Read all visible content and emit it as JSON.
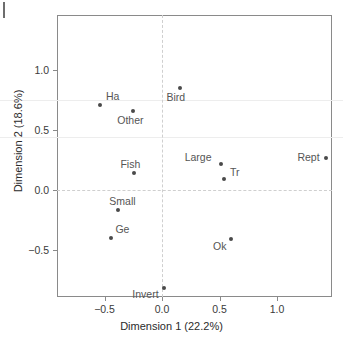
{
  "chart_data": {
    "type": "scatter",
    "title": "",
    "xlabel": "Dimension 1 (22.2%)",
    "ylabel": "Dimension 2 (18.6%)",
    "xlim": [
      -0.91,
      1.48
    ],
    "ylim": [
      -0.92,
      1.35
    ],
    "xticks": [
      "-0.5",
      "0.0",
      "0.5",
      "1.0"
    ],
    "xtick_values": [
      -0.5,
      0.0,
      0.5,
      1.0
    ],
    "yticks": [
      "-0.5",
      "0.0",
      "0.5",
      "1.0"
    ],
    "ytick_values": [
      -0.5,
      0.0,
      0.5,
      1.0
    ],
    "grid": "faint horizontal lines at y=0.75 and y=0.44; dashed reference lines at x=0 and y=0",
    "legend": "none",
    "point_color": "#4a4a4a",
    "label_color": "#555555",
    "points": [
      {
        "label": "Ha",
        "x": -0.54,
        "y": 0.71,
        "label_dx": 6,
        "label_dy": -14
      },
      {
        "label": "Other",
        "x": -0.25,
        "y": 0.66,
        "label_dx": -16,
        "label_dy": 4
      },
      {
        "label": "Bird",
        "x": 0.16,
        "y": 0.85,
        "label_dx": -14,
        "label_dy": 4
      },
      {
        "label": "Fish",
        "x": -0.24,
        "y": 0.14,
        "label_dx": -14,
        "label_dy": -14
      },
      {
        "label": "Large",
        "x": 0.51,
        "y": 0.22,
        "label_dx": -36,
        "label_dy": -12
      },
      {
        "label": "Tr",
        "x": 0.54,
        "y": 0.09,
        "label_dx": 6,
        "label_dy": -12
      },
      {
        "label": "Rept",
        "x": 1.43,
        "y": 0.27,
        "label_dx": -29,
        "label_dy": -6
      },
      {
        "label": "Small",
        "x": -0.38,
        "y": -0.17,
        "label_dx": -9,
        "label_dy": -14
      },
      {
        "label": "Ge",
        "x": -0.44,
        "y": -0.4,
        "label_dx": 4,
        "label_dy": -14
      },
      {
        "label": "Ok",
        "x": 0.6,
        "y": -0.41,
        "label_dx": -18,
        "label_dy": 2
      },
      {
        "label": "Invert",
        "x": 0.02,
        "y": -0.82,
        "label_dx": -32,
        "label_dy": 1
      }
    ]
  }
}
